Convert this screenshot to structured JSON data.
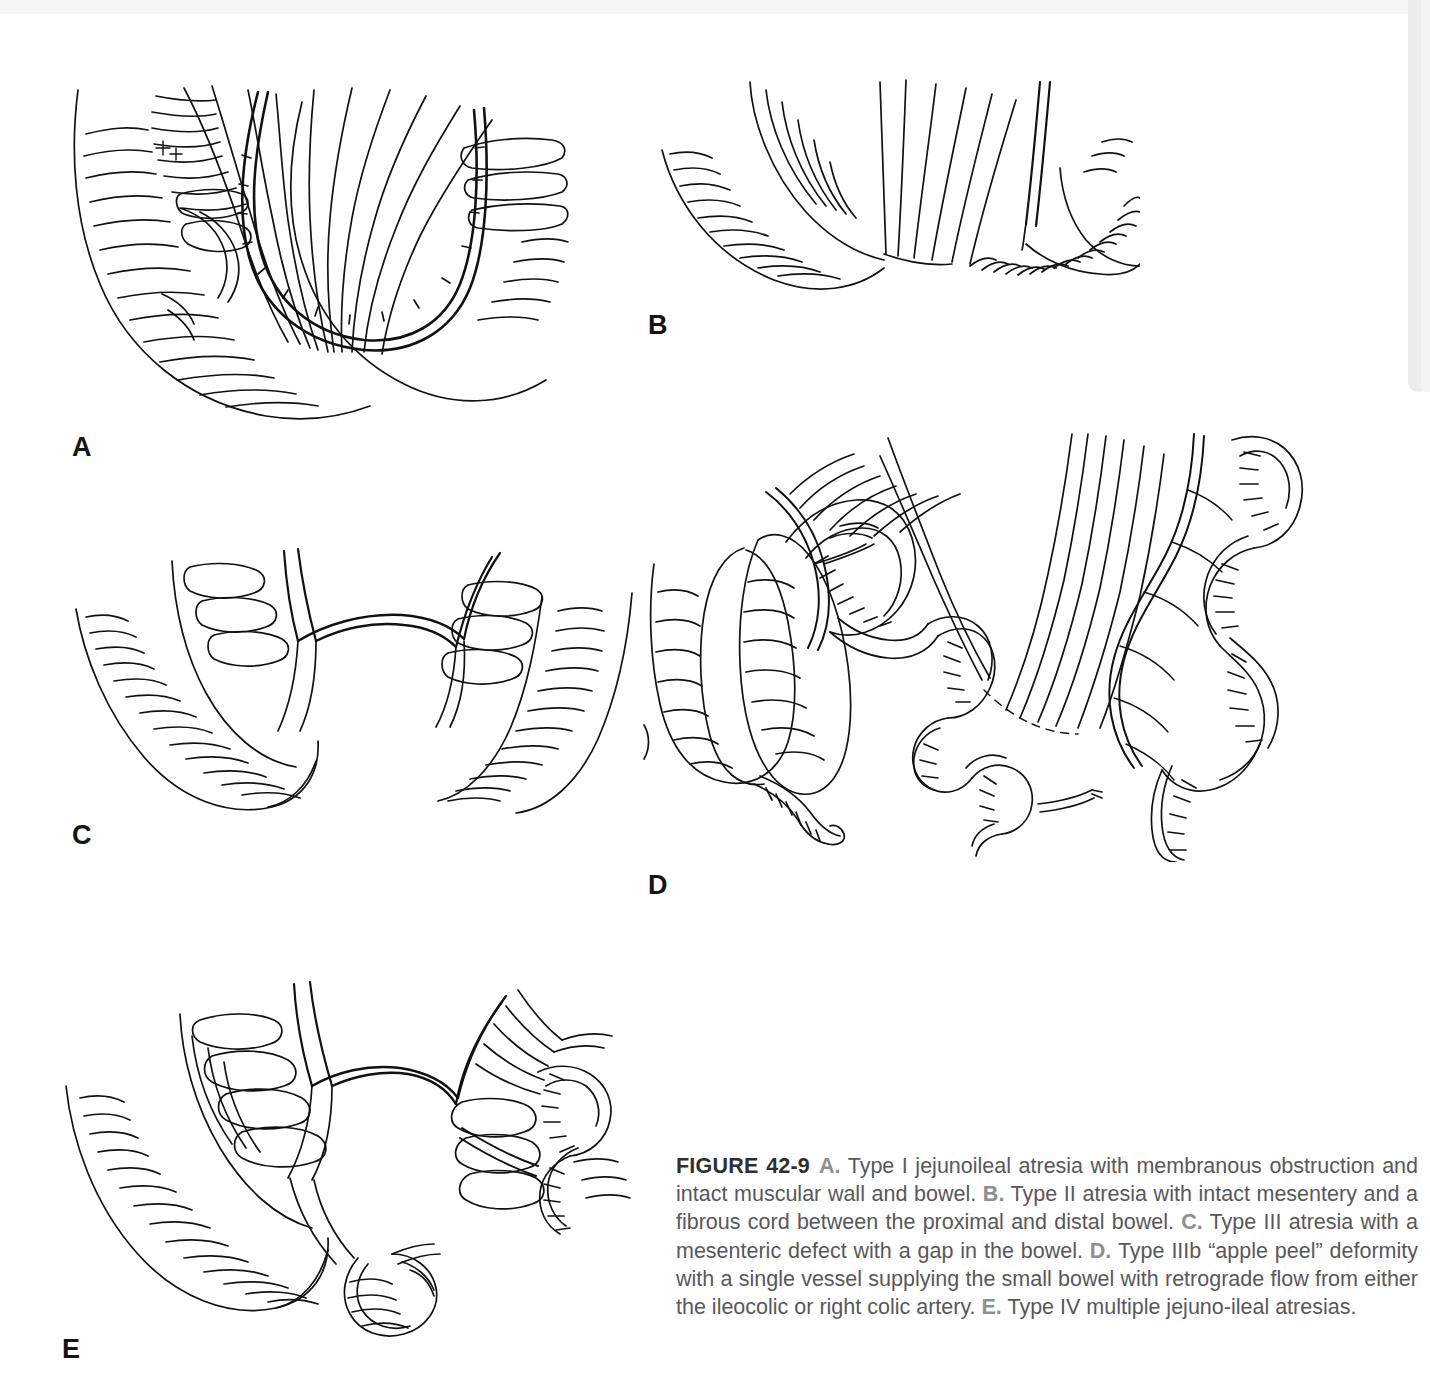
{
  "page": {
    "background_color": "#ffffff",
    "ink_color": "#111111",
    "thumb_tab_color": "#ebecee"
  },
  "figure": {
    "number_label": "FIGURE 42-9",
    "caption_text_color": "#58585a",
    "caption_label_color": "#8d8f92",
    "segments": [
      {
        "label": "A.",
        "text": "Type I jejunoileal atresia with membranous obstruction and intact muscular wall and bowel."
      },
      {
        "label": "B.",
        "text": "Type II atresia with intact mesentery and a fibrous cord between the proximal and distal bowel."
      },
      {
        "label": "C.",
        "text": "Type III atresia with a mesenteric defect with a gap in the bowel."
      },
      {
        "label": "D.",
        "text": "Type IIIb “apple peel” deformity with a single vessel supplying the small bowel with retrograde flow from either the ileocolic or right colic artery."
      },
      {
        "label": "E.",
        "text": "Type IV multiple jejuno-ileal atresias."
      }
    ]
  },
  "panels": [
    {
      "id": "A",
      "label": "A",
      "title": "Type I jejunoileal atresia",
      "description": "Dilated proximal bowel loop joined to collapsed distal bowel with an intraluminal membranous web; mesentery intact with arcade vessels."
    },
    {
      "id": "B",
      "label": "B",
      "title": "Type II atresia",
      "description": "Blind proximal and distal bowel ends connected by a fibrous cord with intact mesentery."
    },
    {
      "id": "C",
      "label": "C",
      "title": "Type III atresia",
      "description": "Blind bowel ends separated by a V-shaped mesenteric defect and a gap in the bowel."
    },
    {
      "id": "D",
      "label": "D",
      "title": "Type IIIb apple peel deformity",
      "description": "Cecum and appendix with short proximal jejunum; distal bowel coiled around a single marginal vessel supplied retrograde from the ileocolic or right colic artery."
    },
    {
      "id": "E",
      "label": "E",
      "title": "Type IV multiple jejunoileal atresias",
      "description": "Multiple atretic segments in series along the jejunum and ileum, sausage-string appearance."
    }
  ]
}
